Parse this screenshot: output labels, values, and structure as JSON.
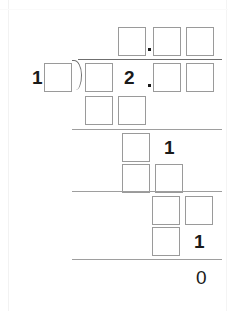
{
  "worksheet": {
    "type": "long-division",
    "description": "Long division exercise with blank answer boxes",
    "printed_digits": {
      "divisor": "1",
      "dividend_digit": "2",
      "dividend_decimal": ".",
      "quotient_decimal": ".",
      "partial_digit_1": "1",
      "partial_digit_2": "1",
      "remainder": "0"
    },
    "quotient_row": {
      "boxes": 3,
      "decimal_after_box_index": 1
    },
    "divisor_row": {
      "digit": "1",
      "boxes": 1
    },
    "dividend_row": {
      "leading_boxes": 1,
      "digit": "2",
      "decimal": ".",
      "trailing_boxes": 2
    },
    "work_rows": [
      {
        "boxes": 2,
        "digit": ""
      },
      {
        "boxes": 1,
        "digit": "1"
      },
      {
        "boxes": 2,
        "digit": ""
      },
      {
        "boxes": 2,
        "digit": ""
      },
      {
        "boxes": 1,
        "digit": "1"
      }
    ],
    "final_answer": "0",
    "colors": {
      "box_border": "#9a9a9a",
      "rule": "#9e9e9e",
      "ink": "#1a1a1a",
      "paper": "#ffffff"
    }
  }
}
